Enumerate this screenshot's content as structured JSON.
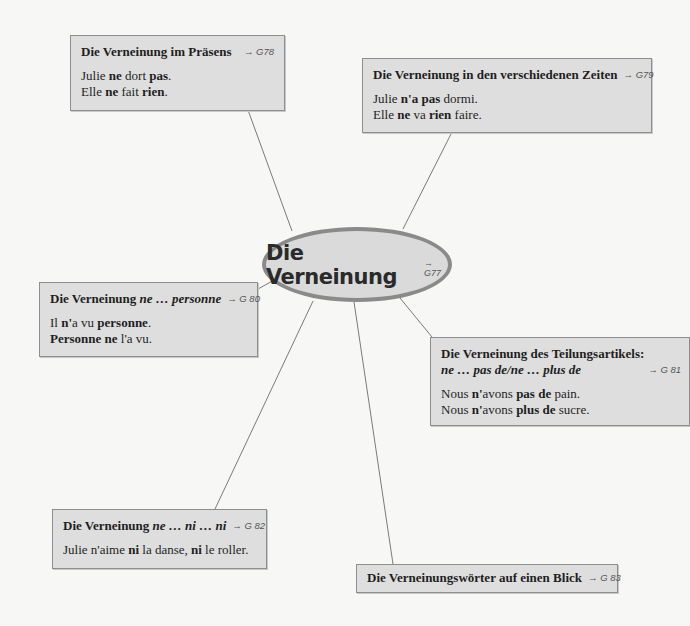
{
  "center": {
    "title": "Die Verneinung",
    "ref": "→ G77"
  },
  "boxes": [
    {
      "id": "praesens",
      "title": "Die Verneinung im Präsens",
      "ref": "→ G78",
      "lines": [
        [
          "Julie ",
          [
            "ne"
          ],
          " dort ",
          [
            "pas"
          ],
          "."
        ],
        [
          "Elle ",
          [
            "ne"
          ],
          " fait ",
          [
            "rien"
          ],
          "."
        ]
      ]
    },
    {
      "id": "zeiten",
      "title": "Die Verneinung in den verschiedenen Zeiten",
      "ref": "→ G79",
      "lines": [
        [
          "Julie ",
          [
            "n'a"
          ],
          " ",
          [
            "pas"
          ],
          " dormi."
        ],
        [
          "Elle ",
          [
            "ne"
          ],
          " va ",
          [
            "rien"
          ],
          " faire."
        ]
      ]
    },
    {
      "id": "personne",
      "title": "Die Verneinung ",
      "title_italic": "ne … personne",
      "ref": "→ G 80",
      "lines": [
        [
          "Il ",
          [
            "n'"
          ],
          "a vu ",
          [
            "personne"
          ],
          "."
        ],
        [
          [
            "Personne ne"
          ],
          " l'a vu."
        ]
      ]
    },
    {
      "id": "teilungsartikel",
      "title": "Die Verneinung des Teilungsartikels:",
      "title2_italic": "ne … pas de/ne … plus de",
      "ref": "→ G 81",
      "lines": [
        [
          "Nous ",
          [
            "n'"
          ],
          "avons ",
          [
            "pas de"
          ],
          " pain."
        ],
        [
          "Nous ",
          [
            "n'"
          ],
          "avons ",
          [
            "plus de"
          ],
          " sucre."
        ]
      ]
    },
    {
      "id": "ni",
      "title": "Die Verneinung ",
      "title_italic": "ne … ni … ni",
      "ref": "→ G 82",
      "lines": [
        [
          "Julie n'aime ",
          [
            "ni"
          ],
          " la danse, ",
          [
            "ni"
          ],
          " le roller."
        ]
      ]
    },
    {
      "id": "blick",
      "title": "Die Verneinungswörter auf einen Blick",
      "ref": "→ G 83",
      "lines": []
    }
  ],
  "colors": {
    "box_bg": "#dedede",
    "box_border": "#8e8e8e",
    "ellipse_border": "#8a8a8a",
    "line": "#7a7a7a",
    "background": "#f7f7f6"
  }
}
